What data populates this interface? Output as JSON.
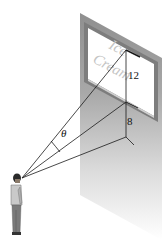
{
  "diagram": {
    "type": "billboard-viewing-angle",
    "billboard_text": [
      "Ice",
      "Cream"
    ],
    "labels": {
      "billboard_height": "12",
      "height_above_eye": "8",
      "angle": "θ"
    },
    "colors": {
      "wall": "#9a9a9a",
      "billboard_border": "#7a7a7a",
      "billboard_face": "#ffffff",
      "lines": "#1a1a1a",
      "ad_text": "#b8b8b8"
    }
  }
}
